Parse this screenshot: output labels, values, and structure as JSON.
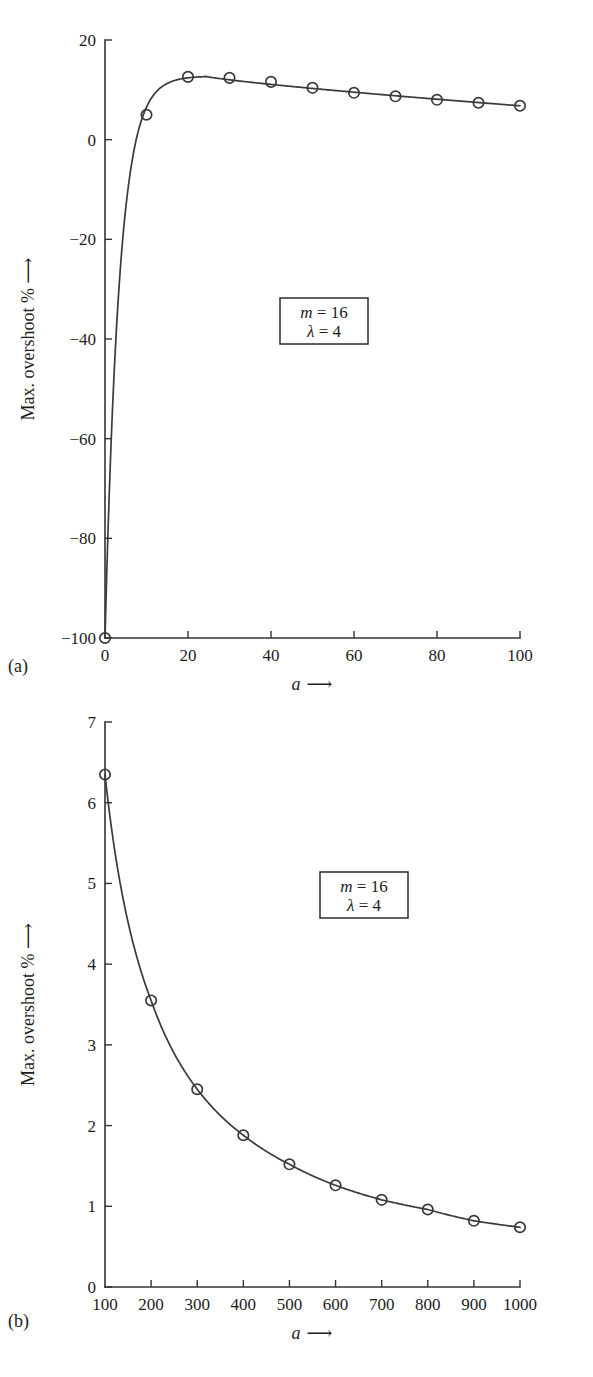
{
  "figures": [
    {
      "panel_label": "(a)",
      "annotation": {
        "line1_var": "m",
        "line1_val": "= 16",
        "line2_var": "λ",
        "line2_val": "= 4"
      },
      "chart_data": {
        "type": "line",
        "title": "",
        "subtitle": "",
        "xlabel": "a ⟶",
        "ylabel": "Max. overshoot % ⟶",
        "xlabel_var": "a",
        "xlabel_arrow": "⟶",
        "ylabel_text": "Max. overshoot %",
        "ylabel_arrow": "⟶",
        "xlim": [
          0,
          100
        ],
        "ylim": [
          -100,
          20
        ],
        "xticks": [
          0,
          20,
          40,
          60,
          80,
          100
        ],
        "xtick_labels": [
          "0",
          "20",
          "40",
          "60",
          "80",
          "100"
        ],
        "yticks": [
          -100,
          -80,
          -60,
          -40,
          -20,
          0,
          20
        ],
        "ytick_labels": [
          "-100",
          "-80",
          "-60",
          "-40",
          "-20",
          "0",
          "20"
        ],
        "x": [
          0,
          10,
          20,
          30,
          40,
          50,
          60,
          70,
          80,
          90,
          100
        ],
        "values": [
          -100,
          5.0,
          12.6,
          12.4,
          11.6,
          10.4,
          9.4,
          8.7,
          8.0,
          7.4,
          6.8
        ],
        "marker": "open-circle",
        "grid": false,
        "legend": "none",
        "annotations": [
          "m = 16",
          "λ = 4"
        ]
      }
    },
    {
      "panel_label": "(b)",
      "annotation": {
        "line1_var": "m",
        "line1_val": "= 16",
        "line2_var": "λ",
        "line2_val": "= 4"
      },
      "chart_data": {
        "type": "line",
        "title": "",
        "subtitle": "",
        "xlabel": "a ⟶",
        "ylabel": "Max. overshoot % ⟶",
        "xlabel_var": "a",
        "xlabel_arrow": "⟶",
        "ylabel_text": "Max. overshoot %",
        "ylabel_arrow": "⟶",
        "xlim": [
          100,
          1000
        ],
        "ylim": [
          0,
          7
        ],
        "xticks": [
          100,
          200,
          300,
          400,
          500,
          600,
          700,
          800,
          900,
          1000
        ],
        "xtick_labels": [
          "100",
          "200",
          "300",
          "400",
          "500",
          "600",
          "700",
          "800",
          "900",
          "1000"
        ],
        "yticks": [
          0,
          1,
          2,
          3,
          4,
          5,
          6,
          7
        ],
        "ytick_labels": [
          "0",
          "1",
          "2",
          "3",
          "4",
          "5",
          "6",
          "7"
        ],
        "x": [
          100,
          200,
          300,
          400,
          500,
          600,
          700,
          800,
          900,
          1000
        ],
        "values": [
          6.35,
          3.55,
          2.45,
          1.88,
          1.52,
          1.26,
          1.08,
          0.96,
          0.82,
          0.74
        ],
        "marker": "open-circle",
        "grid": false,
        "legend": "none",
        "annotations": [
          "m = 16",
          "λ = 4"
        ]
      }
    }
  ]
}
